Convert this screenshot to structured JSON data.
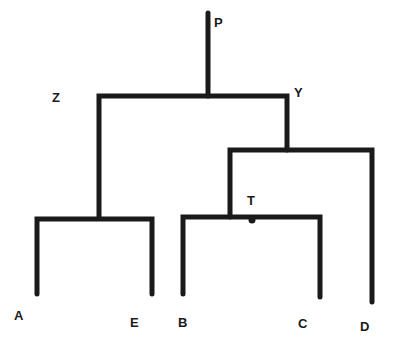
{
  "diagram": {
    "type": "phylogenetic-tree",
    "line_color": "#1a1a1a",
    "background": "#ffffff",
    "nodes": {
      "root": {
        "label": "P",
        "x": 218,
        "y": 16
      },
      "z": {
        "label": "Z",
        "x": 52,
        "y": 91
      },
      "y": {
        "label": "Y",
        "x": 295,
        "y": 86
      },
      "t": {
        "label": "T",
        "x": 247,
        "y": 194
      }
    },
    "leaves": {
      "a": {
        "label": "A",
        "x": 14,
        "y": 309
      },
      "e": {
        "label": "E",
        "x": 130,
        "y": 316
      },
      "b": {
        "label": "B",
        "x": 178,
        "y": 316
      },
      "c": {
        "label": "C",
        "x": 298,
        "y": 317
      },
      "d": {
        "label": "D",
        "x": 360,
        "y": 320
      }
    },
    "edges": [
      {
        "from": "P",
        "to": "root-junction"
      },
      {
        "from": "root-junction",
        "to": "Z"
      },
      {
        "from": "root-junction",
        "to": "Y"
      },
      {
        "from": "Z",
        "to": "A"
      },
      {
        "from": "Z",
        "to": "E"
      },
      {
        "from": "Y",
        "to": "T"
      },
      {
        "from": "Y",
        "to": "D"
      },
      {
        "from": "T",
        "to": "B"
      },
      {
        "from": "T",
        "to": "C"
      }
    ]
  }
}
